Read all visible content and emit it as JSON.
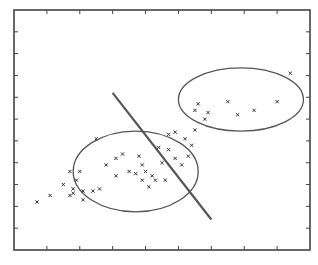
{
  "chart_data": {
    "type": "scatter",
    "title": "",
    "xlabel": "",
    "ylabel": "",
    "grid": false,
    "legend": "none",
    "xlim": [
      0,
      9
    ],
    "ylim": [
      0,
      11
    ],
    "x_ticks": [
      1,
      2,
      3,
      4,
      5,
      6,
      7,
      8
    ],
    "y_ticks": [
      1,
      2,
      3,
      4,
      5,
      6,
      7,
      8,
      9,
      10
    ],
    "tick_labels_visible": false,
    "series": [
      {
        "name": "cluster-a",
        "marker": "x",
        "points": [
          [
            0.7,
            2.2
          ],
          [
            1.1,
            2.5
          ],
          [
            2.5,
            5.1
          ],
          [
            1.7,
            3.6
          ],
          [
            2.0,
            3.6
          ],
          [
            1.9,
            3.2
          ],
          [
            1.5,
            3.0
          ],
          [
            1.8,
            2.8
          ],
          [
            1.8,
            2.6
          ],
          [
            1.7,
            2.5
          ],
          [
            2.1,
            2.7
          ],
          [
            2.1,
            2.3
          ],
          [
            2.4,
            2.7
          ],
          [
            2.6,
            2.8
          ],
          [
            2.8,
            3.9
          ],
          [
            3.1,
            4.2
          ],
          [
            3.3,
            4.4
          ],
          [
            3.1,
            3.4
          ],
          [
            3.5,
            3.6
          ],
          [
            3.7,
            3.5
          ],
          [
            3.8,
            4.3
          ],
          [
            3.9,
            3.9
          ],
          [
            4.0,
            3.6
          ],
          [
            4.1,
            2.9
          ],
          [
            4.2,
            3.4
          ],
          [
            4.3,
            3.2
          ],
          [
            4.6,
            3.2
          ],
          [
            3.9,
            3.2
          ],
          [
            4.5,
            4.0
          ],
          [
            4.4,
            4.7
          ],
          [
            4.7,
            4.6
          ],
          [
            4.9,
            4.2
          ],
          [
            4.7,
            5.3
          ],
          [
            5.1,
            3.9
          ],
          [
            5.4,
            4.8
          ],
          [
            5.3,
            4.3
          ]
        ]
      },
      {
        "name": "cluster-b",
        "marker": "x",
        "points": [
          [
            4.9,
            5.4
          ],
          [
            5.2,
            5.1
          ],
          [
            5.5,
            5.5
          ],
          [
            5.5,
            6.4
          ],
          [
            5.6,
            6.7
          ],
          [
            5.8,
            6.0
          ],
          [
            5.9,
            6.3
          ],
          [
            6.8,
            6.2
          ],
          [
            7.3,
            6.4
          ],
          [
            8.0,
            6.8
          ],
          [
            8.4,
            8.1
          ],
          [
            6.5,
            6.8
          ]
        ]
      }
    ],
    "ellipses": [
      {
        "name": "cluster-a-boundary",
        "center": [
          3.7,
          3.6
        ],
        "radii": [
          3.8,
          3.7
        ]
      },
      {
        "name": "cluster-b-boundary",
        "center": [
          6.9,
          6.9
        ],
        "radii": [
          3.8,
          2.9
        ]
      }
    ],
    "separator_line": {
      "from": [
        3.0,
        7.2
      ],
      "to": [
        6.0,
        1.4
      ]
    }
  }
}
